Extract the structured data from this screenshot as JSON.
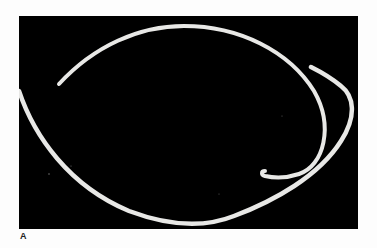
{
  "figure": {
    "panel_label": "A",
    "photo": {
      "description": "Elongated white worm-like specimen curled on black background",
      "background_color": "#000000",
      "specimen_color": "#e8e8e6"
    }
  }
}
